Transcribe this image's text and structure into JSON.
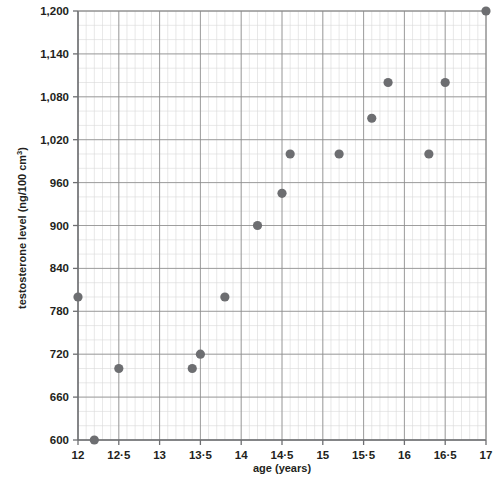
{
  "chart_data": {
    "type": "scatter",
    "title": "",
    "xlabel": "age (years)",
    "ylabel": "testosterone level (ng/100 cm",
    "ylabel_sup": "3",
    "ylabel_tail": ")",
    "xlim": [
      12,
      17
    ],
    "ylim": [
      600,
      1200
    ],
    "x_major_ticks": [
      12,
      12.5,
      13,
      13.5,
      14,
      14.5,
      15,
      15.5,
      16,
      16.5,
      17
    ],
    "x_tick_labels": [
      "12",
      "12·5",
      "13",
      "13·5",
      "14",
      "14·5",
      "15",
      "15·5",
      "16",
      "16·5",
      "17"
    ],
    "x_minor_step": 0.1,
    "y_major_ticks": [
      600,
      660,
      720,
      780,
      840,
      900,
      960,
      1020,
      1080,
      1140,
      1200
    ],
    "y_tick_labels": [
      "600",
      "660",
      "720",
      "780",
      "840",
      "900",
      "960",
      "1,020",
      "1,080",
      "1,140",
      "1,200"
    ],
    "y_minor_step": 20,
    "grid": true,
    "grid_major_color": "#8a8a8a",
    "grid_minor_color": "#d8d8d8",
    "axis_color": "#6d6e71",
    "marker_color": "#6d6e71",
    "marker_radius": 4.6,
    "legend": "none",
    "points": [
      {
        "x": 12.0,
        "y": 800
      },
      {
        "x": 12.2,
        "y": 600
      },
      {
        "x": 12.5,
        "y": 700
      },
      {
        "x": 13.4,
        "y": 700
      },
      {
        "x": 13.5,
        "y": 720
      },
      {
        "x": 13.8,
        "y": 800
      },
      {
        "x": 14.2,
        "y": 900
      },
      {
        "x": 14.5,
        "y": 945
      },
      {
        "x": 14.6,
        "y": 1000
      },
      {
        "x": 15.2,
        "y": 1000
      },
      {
        "x": 15.6,
        "y": 1050
      },
      {
        "x": 15.8,
        "y": 1100
      },
      {
        "x": 16.3,
        "y": 1000
      },
      {
        "x": 16.5,
        "y": 1100
      },
      {
        "x": 17.0,
        "y": 1200
      }
    ]
  },
  "plot_geometry": {
    "left": 78,
    "right": 486,
    "top": 11,
    "bottom": 440
  }
}
